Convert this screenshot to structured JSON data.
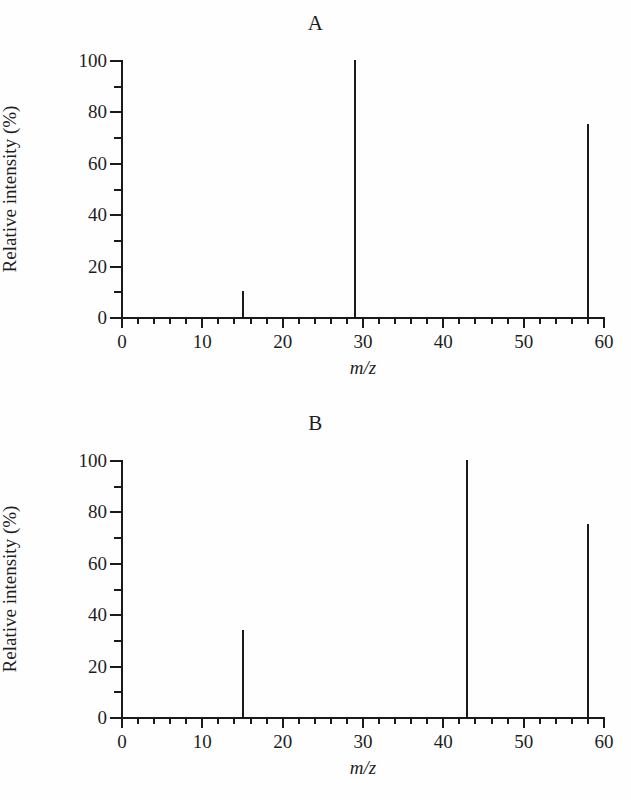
{
  "figure": {
    "background_color": "#fefefe",
    "ink_color": "#1a1a1a"
  },
  "panels": [
    {
      "id": "a",
      "title": "A",
      "xlabel": "m/z",
      "ylabel": "Relative intensity (%)"
    },
    {
      "id": "b",
      "title": "B",
      "xlabel": "m/z",
      "ylabel": "Relative intensity (%)"
    }
  ],
  "axes": {
    "x_major_ticks": [
      0,
      10,
      20,
      30,
      40,
      50,
      60
    ],
    "x_major_tick_labels": [
      "0",
      "10",
      "20",
      "30",
      "40",
      "50",
      "60"
    ],
    "x_minor_tick_step": 2,
    "y_major_ticks": [
      0,
      20,
      40,
      60,
      80,
      100
    ],
    "y_major_tick_labels": [
      "0",
      "20",
      "40",
      "60",
      "80",
      "100"
    ],
    "y_minor_ticks": [
      10,
      30,
      50,
      70,
      90
    ]
  },
  "chart_data": [
    {
      "type": "bar",
      "title": "A",
      "xlabel": "m/z",
      "ylabel": "Relative intensity (%)",
      "xlim": [
        0,
        60
      ],
      "ylim": [
        0,
        100
      ],
      "grid": false,
      "legend": false,
      "x": [
        15,
        29,
        58
      ],
      "values": [
        10,
        100,
        75
      ],
      "categories": [
        "15",
        "29",
        "58"
      ],
      "series": [
        {
          "name": "Mass spectrum A",
          "values": [
            10,
            100,
            75
          ]
        }
      ],
      "annotations": []
    },
    {
      "type": "bar",
      "title": "B",
      "xlabel": "m/z",
      "ylabel": "Relative intensity (%)",
      "xlim": [
        0,
        60
      ],
      "ylim": [
        0,
        100
      ],
      "grid": false,
      "legend": false,
      "x": [
        15,
        43,
        58
      ],
      "values": [
        34,
        100,
        75
      ],
      "categories": [
        "15",
        "43",
        "58"
      ],
      "series": [
        {
          "name": "Mass spectrum B",
          "values": [
            34,
            100,
            75
          ]
        }
      ],
      "annotations": []
    }
  ]
}
